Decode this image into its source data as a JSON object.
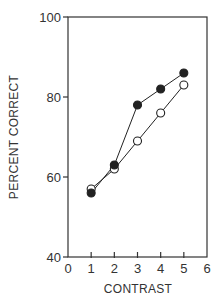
{
  "chart_data": {
    "type": "line",
    "title": "",
    "xlabel": "CONTRAST",
    "ylabel": "PERCENT CORRECT",
    "xlim": [
      0,
      6
    ],
    "ylim": [
      40,
      100
    ],
    "x_ticks": [
      0,
      1,
      2,
      3,
      4,
      5,
      6
    ],
    "y_ticks": [
      40,
      60,
      80,
      100
    ],
    "grid": false,
    "legend": null,
    "x": [
      1,
      2,
      3,
      4,
      5
    ],
    "series": [
      {
        "name": "filled",
        "marker": "filled-circle",
        "values": [
          56,
          63,
          78,
          82,
          86
        ]
      },
      {
        "name": "open",
        "marker": "open-circle",
        "values": [
          57,
          62,
          69,
          76,
          83
        ]
      }
    ]
  },
  "colors": {
    "line": "#222222",
    "axis": "#333333",
    "background": "#ffffff"
  }
}
